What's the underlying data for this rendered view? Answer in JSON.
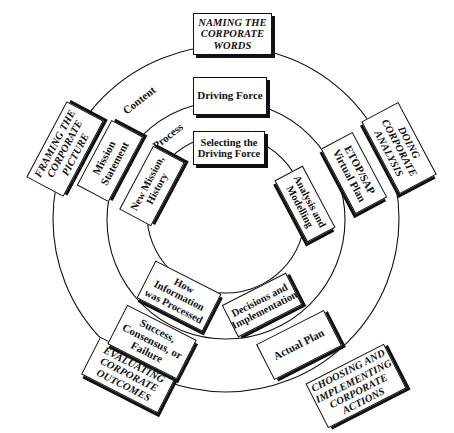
{
  "diagram": {
    "type": "concentric-cycle",
    "center": [
      226,
      216
    ],
    "rings": [
      {
        "name": "outer",
        "radius": 174
      },
      {
        "name": "middle",
        "radius": 120
      },
      {
        "name": "inner",
        "radius": 80
      }
    ],
    "ring_labels": {
      "content": "Content",
      "process": "Process"
    },
    "spokes": [
      {
        "id": "naming",
        "outer": "NAMING THE CORPORATE WORDS",
        "middle": "Driving Force",
        "inner": "Selecting the Driving Force"
      },
      {
        "id": "doing",
        "outer": "DOING CORPORATE ANALYSIS",
        "middle": "ETOP/SAP Virtual Plan",
        "inner": "Analysis and Modelling"
      },
      {
        "id": "choosing",
        "outer": "CHOOSING AND IMPLEMENTING CORPORATE ACTIONS",
        "middle": "Actual Plan",
        "inner": "Decisions and Implementation"
      },
      {
        "id": "evaluating",
        "outer": "EVALUATING CORPORATE OUTCOMES",
        "middle": "Success, Consensus, or Failure",
        "inner": "How Information was Processed"
      },
      {
        "id": "framing",
        "outer": "FRAMING THE CORPORATE PICTURE",
        "middle": "Mission Statement",
        "inner": "New Mission, History"
      }
    ],
    "colors": {
      "line": "#111111",
      "box_fill": "#ffffff",
      "shadow": "#111111"
    }
  }
}
